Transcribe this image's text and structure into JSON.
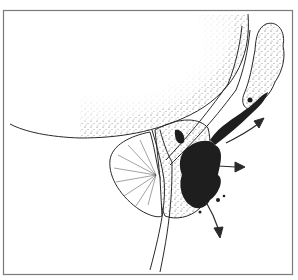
{
  "figure": {
    "type": "medical-line-illustration",
    "colors": {
      "ink": "#2a2a2a",
      "frame": "#7a7a7a",
      "background": "#ffffff",
      "mass": "#1e1e1e"
    },
    "arrows": [
      {
        "name": "arrow-up-right",
        "direction": "up-right"
      },
      {
        "name": "arrow-right",
        "direction": "right"
      },
      {
        "name": "arrow-down",
        "direction": "down"
      }
    ]
  }
}
